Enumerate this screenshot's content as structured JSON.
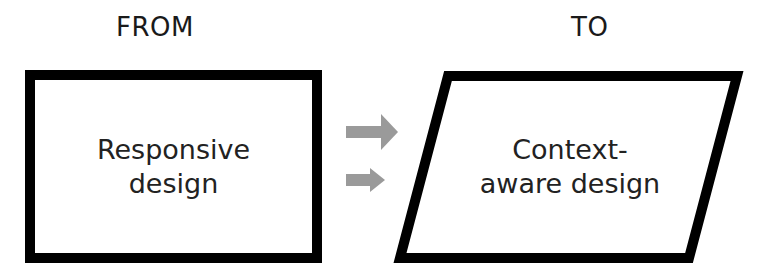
{
  "diagram": {
    "from_label": "FROM",
    "to_label": "TO",
    "from_box": {
      "shape": "rectangle",
      "line1": "Responsive",
      "line2": "design"
    },
    "to_box": {
      "shape": "parallelogram",
      "line1": "Context-",
      "line2": "aware design"
    },
    "arrows": [
      {
        "icon": "arrow-right-icon",
        "color": "#9a9a9a"
      },
      {
        "icon": "arrow-right-icon",
        "color": "#9a9a9a"
      }
    ],
    "colors": {
      "stroke": "#000000",
      "arrow": "#9a9a9a",
      "background": "#ffffff"
    }
  }
}
